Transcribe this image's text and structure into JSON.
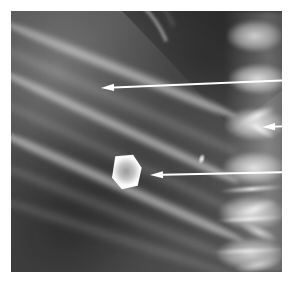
{
  "figure": {
    "kind": "radiograph",
    "modality": "plain-film-x-ray",
    "caption": "",
    "background_color": "#ffffff",
    "plate": {
      "x": 11,
      "y": 11,
      "width": 271,
      "height": 261,
      "base_color": "#5a5a5a",
      "tone_range": [
        "#1a1a1a",
        "#ffffff"
      ]
    }
  },
  "annotations": {
    "arrow_color": "#ffffff",
    "arrows": [
      {
        "id": "arrow-upper",
        "label": "",
        "direction": "left",
        "tip": {
          "x": 101,
          "y": 88
        },
        "tail": {
          "x": 293,
          "y": 80
        },
        "points_to": "rib-margin-density"
      },
      {
        "id": "arrow-right",
        "label": "",
        "direction": "left",
        "tip": {
          "x": 262,
          "y": 127
        },
        "tail": {
          "x": 293,
          "y": 126
        },
        "points_to": "vertebral-process-density"
      },
      {
        "id": "arrow-lower",
        "label": "",
        "direction": "left",
        "tip": {
          "x": 150,
          "y": 175
        },
        "tail": {
          "x": 293,
          "y": 172
        },
        "points_to": "radiopaque-calculus"
      }
    ]
  },
  "features": [
    {
      "name": "radiopaque-calculus",
      "description": "bright pentagonal opacity",
      "x": 99,
      "y": 143,
      "width": 33,
      "height": 36,
      "brightness": "#ffffff"
    },
    {
      "name": "calculus-lucent-center",
      "description": "relatively lucent core",
      "x": 106,
      "y": 151,
      "width": 18,
      "height": 19
    },
    {
      "name": "calcific-speck",
      "description": "small bright fleck",
      "x": 187,
      "y": 143,
      "width": 7,
      "height": 11
    },
    {
      "name": "liver-diaphragm-shadow",
      "description": "dark wedge upper right"
    },
    {
      "name": "rib-shadows",
      "description": "oblique bands upper left to lower right"
    },
    {
      "name": "lumbar-spine",
      "description": "vertebral bodies and processes along right edge"
    }
  ],
  "ribs": [
    {
      "left": -6,
      "top": 4,
      "width": 250,
      "height": 16,
      "rotate": 22,
      "dim": false
    },
    {
      "left": -10,
      "top": 28,
      "width": 260,
      "height": 17,
      "rotate": 24,
      "dim": true
    },
    {
      "left": -12,
      "top": 52,
      "width": 265,
      "height": 15,
      "rotate": 25,
      "dim": false
    },
    {
      "left": -14,
      "top": 82,
      "width": 268,
      "height": 14,
      "rotate": 25,
      "dim": true
    },
    {
      "left": -14,
      "top": 112,
      "width": 270,
      "height": 16,
      "rotate": 24,
      "dim": false
    },
    {
      "left": -12,
      "top": 146,
      "width": 268,
      "height": 15,
      "rotate": 22,
      "dim": true
    },
    {
      "left": -10,
      "top": 182,
      "width": 250,
      "height": 14,
      "rotate": 18,
      "dim": true
    }
  ],
  "vertebrae": [
    {
      "left": 216,
      "top": 8,
      "width": 56,
      "height": 34
    },
    {
      "left": 218,
      "top": 52,
      "width": 58,
      "height": 32
    },
    {
      "left": 214,
      "top": 96,
      "width": 60,
      "height": 34
    },
    {
      "left": 212,
      "top": 140,
      "width": 62,
      "height": 34
    },
    {
      "left": 208,
      "top": 184,
      "width": 66,
      "height": 36
    },
    {
      "left": 206,
      "top": 226,
      "width": 68,
      "height": 34
    }
  ],
  "vertebral_edges": [
    {
      "left": 208,
      "top": 176,
      "width": 66,
      "height": 4,
      "rotate": -4
    },
    {
      "left": 204,
      "top": 206,
      "width": 70,
      "height": 4,
      "rotate": -3
    },
    {
      "left": 202,
      "top": 238,
      "width": 72,
      "height": 4,
      "rotate": -2
    }
  ],
  "processes": [
    {
      "left": 226,
      "top": 98,
      "width": 40,
      "height": 14,
      "rotate": -26
    },
    {
      "left": 232,
      "top": 112,
      "width": 34,
      "height": 12,
      "rotate": 30
    },
    {
      "left": 222,
      "top": 190,
      "width": 44,
      "height": 16,
      "rotate": -18
    },
    {
      "left": 228,
      "top": 214,
      "width": 40,
      "height": 14,
      "rotate": 24
    },
    {
      "left": 224,
      "top": 246,
      "width": 46,
      "height": 16,
      "rotate": -12
    }
  ]
}
